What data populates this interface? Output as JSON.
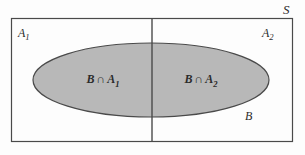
{
  "figure": {
    "kind": "venn-diagram",
    "colors": {
      "background": "#fdfdfd",
      "stroke": "#4a4a4a",
      "ellipse_fill": "#b8b8b8",
      "text": "#2b2b2b"
    },
    "geometry": {
      "rect_x": 11,
      "rect_y": 18,
      "rect_width": 282,
      "rect_height": 124,
      "divider_x": 152,
      "ellipse_cx": 151,
      "ellipse_cy": 80,
      "ellipse_rx": 118,
      "ellipse_ry": 37
    }
  },
  "labels": {
    "sample_space": "S",
    "partition_left_base": "A",
    "partition_left_sub": "1",
    "partition_right_base": "A",
    "partition_right_sub": "2",
    "region_left_base": "B",
    "region_left_op": "∩",
    "region_left_set": "A",
    "region_left_sub": "1",
    "region_right_base": "B",
    "region_right_op": "∩",
    "region_right_set": "A",
    "region_right_sub": "2",
    "event_b": "B"
  }
}
